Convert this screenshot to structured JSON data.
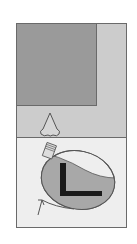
{
  "figure": {
    "title": "",
    "panels": {
      "upper": {
        "label": "",
        "outer_fill": "#cccccc",
        "inner_square_fill": "#9a9a9a",
        "stroke": "#6a6a6a"
      },
      "lower": {
        "label": "",
        "fill": "#eeeeee",
        "stroke": "#6a6a6a"
      }
    },
    "elements": [
      {
        "name": "nose-icon",
        "description": "nose outline"
      },
      {
        "name": "bottle-icon",
        "description": "tilted ellipse with threaded cap"
      },
      {
        "name": "letter-l-icon",
        "description": "black L shape inside ellipse",
        "text": "L"
      },
      {
        "name": "rotation-arrow-icon",
        "description": "curved arrow around ellipse"
      }
    ],
    "colors": {
      "background": "#ffffff",
      "dark_gray": "#9a9a9a",
      "mid_gray": "#cccccc",
      "light_gray": "#eeeeee",
      "liquid": "#a8a8a8",
      "outline": "#555555",
      "black": "#1a1a1a"
    }
  }
}
